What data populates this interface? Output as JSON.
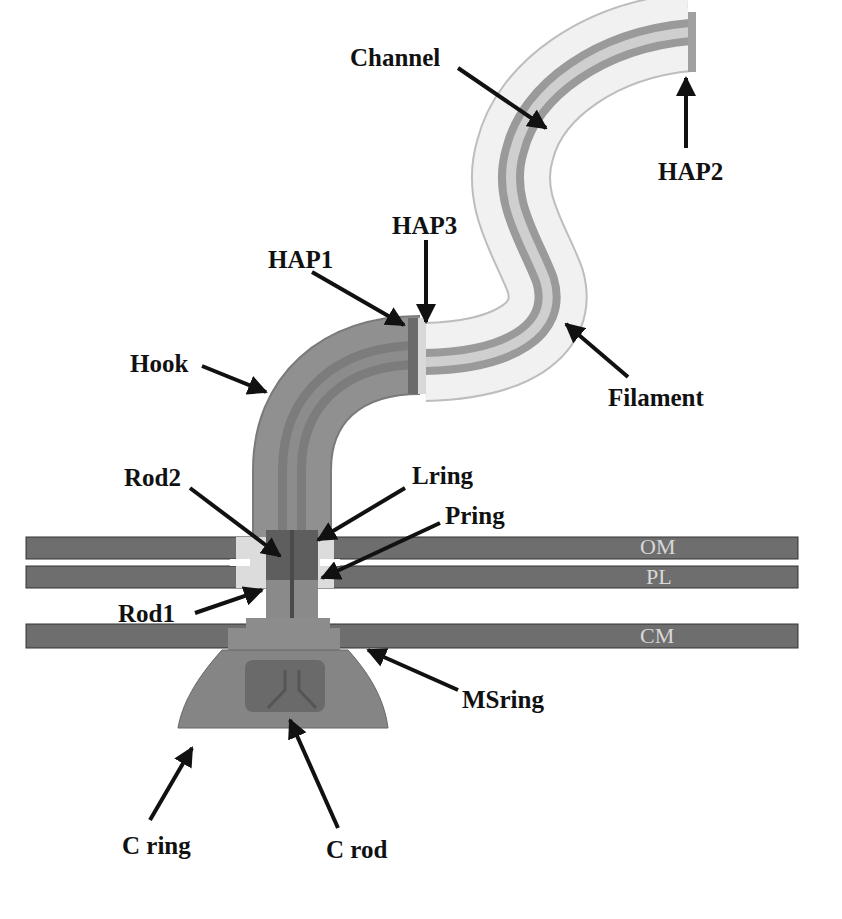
{
  "figure": {
    "labels": {
      "channel": "Channel",
      "hap2": "HAP2",
      "hap3": "HAP3",
      "hap1": "HAP1",
      "hook": "Hook",
      "filament": "Filament",
      "rod2": "Rod2",
      "lring": "Lring",
      "pring": "Pring",
      "rod1": "Rod1",
      "msring": "MSring",
      "cring": "C ring",
      "crod": "C rod"
    },
    "membranes": {
      "om": "OM",
      "pl": "PL",
      "cm": "CM"
    },
    "colors": {
      "membrane": "#6e6e6e",
      "hook": "#8a8a8a",
      "filament": "#ececec",
      "ring_light": "#dcdcdc",
      "basal": "#7d7d7d",
      "arrow": "#111111"
    }
  }
}
